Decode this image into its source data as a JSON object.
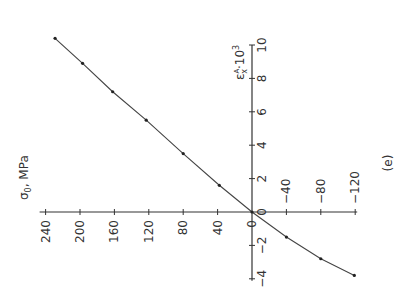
{
  "chart_data": {
    "type": "line",
    "orientation_note": "figure rotated 90deg counter-clockwise on page",
    "panel_label": "(e)",
    "xlabel": "ε_x^A·10^3",
    "xlabel_parts": {
      "base": "ε",
      "sub": "x",
      "sup": "A",
      "suffix": "·10",
      "power": "3"
    },
    "ylabel": "σ_0, MPa",
    "ylabel_parts": {
      "base": "σ",
      "sub": "0",
      "suffix": ", MPa"
    },
    "xlim": [
      -4,
      10
    ],
    "ylim": [
      -120,
      240
    ],
    "x_ticks": [
      -4,
      -2,
      0,
      2,
      4,
      6,
      8,
      10
    ],
    "x_tick_labels": [
      "−4",
      "−2",
      "0",
      "2",
      "4",
      "6",
      "8",
      "10"
    ],
    "y_ticks": [
      -120,
      -80,
      -40,
      0,
      40,
      80,
      120,
      160,
      200,
      240
    ],
    "y_tick_labels": [
      "−120",
      "−80",
      "−40",
      "0",
      "40",
      "80",
      "120",
      "160",
      "200",
      "240"
    ],
    "grid": false,
    "series": [
      {
        "name": "σ0 vs εxA",
        "marker": "dot",
        "x": [
          -3.8,
          -2.8,
          -1.5,
          0,
          1.6,
          3.5,
          5.5,
          7.2,
          8.9,
          10.4
        ],
        "y": [
          -119,
          -80,
          -40,
          0,
          38,
          80,
          123,
          162,
          197,
          229
        ]
      }
    ]
  },
  "colors": {
    "line": "#444444",
    "axis": "#333333",
    "background": "#ffffff"
  }
}
